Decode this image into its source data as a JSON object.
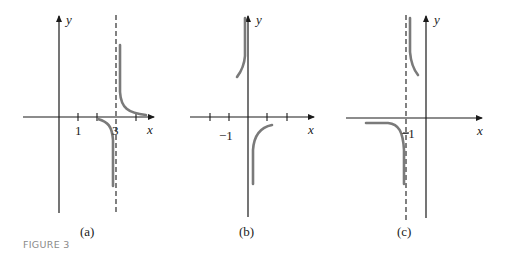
{
  "figure": {
    "caption": "FIGURE 3",
    "caption_color": "#8a8a8a",
    "curve_color": "#7a7a7a",
    "axis_color": "#1a1a1a"
  },
  "panels": [
    {
      "id": "a",
      "label": "(a)",
      "x_axis_label": "x",
      "y_axis_label": "y",
      "tick_labels": [
        "1",
        "3"
      ],
      "vertical_asymptote": "x = 3",
      "horizontal_asymptote": "y = 0",
      "description": "Curve approaches -infinity as x -> 3 from left, +infinity as x -> 3 from right; approaches 0 for large x"
    },
    {
      "id": "b",
      "label": "(b)",
      "x_axis_label": "x",
      "y_axis_label": "y",
      "tick_labels": [
        "-1"
      ],
      "vertical_asymptote": "x = 0",
      "description": "Curve goes to +infinity as x -> 0 from left, to -infinity as x -> 0 from right"
    },
    {
      "id": "c",
      "label": "(c)",
      "x_axis_label": "x",
      "y_axis_label": "y",
      "tick_labels": [
        "-1"
      ],
      "vertical_asymptote": "x = -1",
      "description": "Curve approaches -infinity as x -> -1 from left (levels near y slightly below 0 for far left), +infinity as x -> -1 from right"
    }
  ]
}
